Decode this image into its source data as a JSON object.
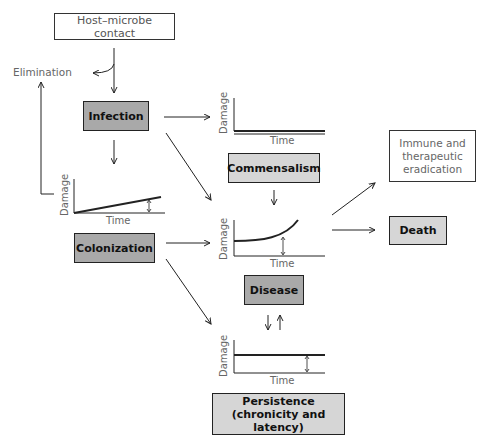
{
  "nodes": {
    "host_contact": "Host–microbe contact",
    "elimination": "Elimination",
    "infection": "Infection",
    "commensalism": "Commensalism",
    "colonization": "Colonization",
    "disease": "Disease",
    "persistence_line1": "Persistence",
    "persistence_line2": "(chronicity and latency)",
    "immune_line1": "Immune and",
    "immune_line2": "therapeutic",
    "immune_line3": "eradication",
    "death": "Death"
  },
  "plots": {
    "y_label": "Damage",
    "x_label": "Time",
    "commensalism": {
      "shape": "flat double line at baseline"
    },
    "colonization": {
      "shape": "linear increase, arrow marks damage"
    },
    "disease": {
      "shape": "exponential rise, arrow marks damage"
    },
    "persistence": {
      "shape": "constant elevated, arrow marks damage"
    }
  },
  "colors": {
    "dark_box": "#a9a9a9",
    "light_box": "#d6d6d6",
    "line": "#222222",
    "muted_text": "#666666"
  }
}
